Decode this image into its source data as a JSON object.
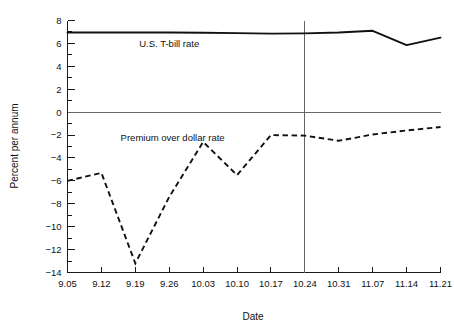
{
  "chart_data": {
    "type": "line",
    "title": "",
    "xlabel": "Date",
    "ylabel": "Percent per annum",
    "x": [
      "9.05",
      "9.12",
      "9.19",
      "9.26",
      "10.03",
      "10.10",
      "10.17",
      "10.24",
      "10.31",
      "11.07",
      "11.14",
      "11.21"
    ],
    "categories": [
      "9.05",
      "9.12",
      "9.19",
      "9.26",
      "10.03",
      "10.10",
      "10.17",
      "10.24",
      "10.31",
      "11.07",
      "11.14",
      "11.21"
    ],
    "xlim": [
      0,
      11
    ],
    "ylim": [
      -14,
      8
    ],
    "y_ticks": [
      -14,
      -12,
      -10,
      -8,
      -6,
      -4,
      -2,
      0,
      2,
      4,
      6,
      8
    ],
    "y_tick_labels": [
      "−14",
      "−12",
      "−10",
      "−8",
      "−6",
      "−4",
      "−2",
      "0",
      "2",
      "4",
      "6",
      "8"
    ],
    "y_minor_step": 1,
    "grid": false,
    "legend": "none",
    "zero_line": 0,
    "reference_line_x": "10.24",
    "series": [
      {
        "name": "U.S. T-bill rate",
        "style": "solid",
        "label_x": "9.26",
        "label_value": 6.0,
        "values": [
          6.95,
          6.95,
          6.95,
          6.95,
          6.93,
          6.9,
          6.85,
          6.88,
          6.95,
          7.1,
          5.85,
          6.5
        ]
      },
      {
        "name": "Premium over dollar rate",
        "style": "dashed",
        "label_x": "9.26",
        "label_value": -2.2,
        "values": [
          -6.0,
          -5.3,
          -13.2,
          -7.4,
          -2.6,
          -5.5,
          -2.0,
          -2.05,
          -2.5,
          -1.95,
          -1.6,
          -1.3
        ]
      }
    ],
    "annotations": [
      {
        "text": "U.S. T-bill rate",
        "x_index": 3,
        "y": 6.0
      },
      {
        "text": "Premium over dollar rate",
        "x_index": 3.1,
        "y": -2.2
      }
    ]
  },
  "labels": {
    "y_axis_title": "Percent per annum",
    "x_axis_title": "Date",
    "series_solid_label": "U.S. T-bill rate",
    "series_dashed_label": "Premium over dollar rate"
  },
  "colors": {
    "line": "#111111",
    "zero_line": "#666666",
    "axis": "#1a1a1a",
    "background": "#ffffff"
  }
}
